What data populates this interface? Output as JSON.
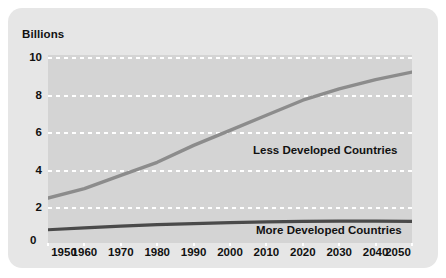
{
  "chart_data": {
    "type": "line",
    "title": "",
    "ylabel": "Billions",
    "xlabel": "",
    "xlim": [
      1950,
      2050
    ],
    "ylim": [
      0,
      10
    ],
    "grid": true,
    "legend_position": "inline-annotation",
    "x": [
      1950,
      1960,
      1970,
      1980,
      1990,
      2000,
      2010,
      2020,
      2030,
      2040,
      2050
    ],
    "xtick_labels": [
      "1950",
      "1960",
      "1970",
      "1980",
      "1990",
      "2000",
      "2010",
      "2020",
      "2030",
      "2040",
      "2050"
    ],
    "ytick_labels": [
      "0",
      "2",
      "4",
      "6",
      "8",
      "10"
    ],
    "yticks": [
      0,
      2,
      4,
      6,
      8,
      10
    ],
    "series": [
      {
        "name": "Less Developed Countries",
        "color": "#8c8c8c",
        "values": [
          2.5,
          3.0,
          3.7,
          4.4,
          5.3,
          6.1,
          6.9,
          7.7,
          8.3,
          8.8,
          9.2
        ]
      },
      {
        "name": "More Developed Countries",
        "color": "#4a4a4a",
        "values": [
          0.81,
          0.91,
          1.0,
          1.08,
          1.14,
          1.19,
          1.23,
          1.26,
          1.27,
          1.27,
          1.26
        ]
      }
    ],
    "annotations": [
      {
        "text": "Less Developed Countries",
        "x": 2012,
        "y": 4.4
      },
      {
        "text": "More Developed Countries",
        "x": 2013,
        "y": 0.35
      }
    ]
  },
  "axis": {
    "y_title": "Billions",
    "y_labels": [
      "10",
      "8",
      "6",
      "4",
      "2",
      "0"
    ],
    "x_labels": [
      "1950",
      "1960",
      "1970",
      "1980",
      "1990",
      "2000",
      "2010",
      "2020",
      "2030",
      "2040",
      "2050"
    ]
  },
  "labels": {
    "less_developed": "Less Developed Countries",
    "more_developed": "More Developed Countries"
  },
  "colors": {
    "page_background": "#ffffff",
    "card_background": "#e6e6e6",
    "plot_background": "#d4d4d4",
    "gridline": "#ffffff",
    "less_developed_line": "#8c8c8c",
    "more_developed_line": "#4a4a4a",
    "text": "#111111"
  }
}
